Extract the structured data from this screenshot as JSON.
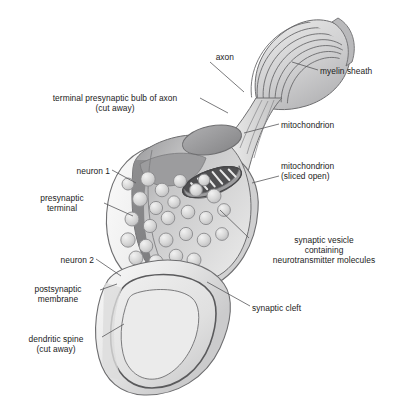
{
  "figure": {
    "background_color": "#ffffff",
    "line_color": "#58585a",
    "text_color": "#1b1b1b",
    "palette": {
      "membrane_outline": "#6e6e70",
      "cytoplasm_light": "#f1f1f1",
      "cytoplasm_mid": "#d9d9d9",
      "cut_face_dark": "#8f8f91",
      "cut_face_darker": "#7a7a7c",
      "vesicle_fill": "#d5d5d5",
      "vesicle_outline": "#8a8a8c",
      "mitochondrion_fill": "#9c9c9e",
      "mitochondrion_sliced_dark": "#4f4f51",
      "myelin_fill": "#cfcfd0",
      "spine_lumen": "#e3e3e3"
    }
  },
  "labels": [
    {
      "id": "axon",
      "name": "label-axon",
      "lines": [
        "axon"
      ],
      "align": "right",
      "x": 188,
      "y": 52,
      "width": 46
    },
    {
      "id": "myelin-sheath",
      "name": "label-myelin-sheath",
      "lines": [
        "myelin sheath"
      ],
      "align": "left",
      "x": 320,
      "y": 66,
      "width": 82
    },
    {
      "id": "terminal-presynaptic-bulb",
      "name": "label-terminal-presynaptic-bulb-of-axon",
      "lines": [
        "terminal presynaptic bulb of axon",
        "(cut away)"
      ],
      "align": "center",
      "x": 32,
      "y": 93,
      "width": 166
    },
    {
      "id": "mitochondrion",
      "name": "label-mitochondrion",
      "lines": [
        "mitochondrion"
      ],
      "align": "left",
      "x": 281,
      "y": 120,
      "width": 86
    },
    {
      "id": "mitochondrion-sliced-open",
      "name": "label-mitochondrion-sliced-open",
      "lines": [
        "mitochondrion",
        "(sliced open)"
      ],
      "align": "left",
      "x": 281,
      "y": 161,
      "width": 86
    },
    {
      "id": "neuron-1",
      "name": "label-neuron-1",
      "lines": [
        "neuron 1"
      ],
      "align": "right",
      "x": 54,
      "y": 166,
      "width": 56
    },
    {
      "id": "presynaptic-terminal",
      "name": "label-presynaptic-terminal",
      "lines": [
        "presynaptic",
        "terminal"
      ],
      "align": "center",
      "x": 22,
      "y": 193,
      "width": 80
    },
    {
      "id": "synaptic-vesicle",
      "name": "label-synaptic-vesicle",
      "lines": [
        "synaptic vesicle",
        "containing",
        "neurotransmitter molecules"
      ],
      "align": "center",
      "x": 251,
      "y": 235,
      "width": 146
    },
    {
      "id": "neuron-2",
      "name": "label-neuron-2",
      "lines": [
        "neuron 2"
      ],
      "align": "right",
      "x": 38,
      "y": 255,
      "width": 56
    },
    {
      "id": "postsynaptic-membrane",
      "name": "label-postsynaptic-membrane",
      "lines": [
        "postsynaptic",
        "membrane"
      ],
      "align": "center",
      "x": 18,
      "y": 284,
      "width": 80
    },
    {
      "id": "synaptic-cleft",
      "name": "label-synaptic-cleft",
      "lines": [
        "synaptic cleft"
      ],
      "align": "left",
      "x": 252,
      "y": 303,
      "width": 82
    },
    {
      "id": "dendritic-spine",
      "name": "label-dendritic-spine",
      "lines": [
        "dendritic spine",
        "(cut away)"
      ],
      "align": "center",
      "x": 12,
      "y": 334,
      "width": 88
    }
  ],
  "leader_lines": [
    {
      "id": "axon",
      "name": "leader-line-axon",
      "path": "M 210 62 L 244 92"
    },
    {
      "id": "myelin-sheath",
      "name": "leader-line-myelin-sheath",
      "path": "M 318 70 L 292 62"
    },
    {
      "id": "terminal-presynaptic-bulb",
      "name": "leader-line-terminal-presynaptic-bulb",
      "path": "M 200 98 L 228 113"
    },
    {
      "id": "mitochondrion",
      "name": "leader-line-mitochondrion",
      "path": "M 279 124 L 244 133"
    },
    {
      "id": "mitochondrion-sliced-open",
      "name": "leader-line-mitochondrion-sliced-open",
      "path": "M 279 176 L 252 183"
    },
    {
      "id": "neuron-1",
      "name": "leader-line-neuron-1",
      "path": "M 112 170 L 136 183"
    },
    {
      "id": "presynaptic-terminal",
      "name": "leader-line-presynaptic-terminal",
      "path": "M 104 203 L 133 216"
    },
    {
      "id": "synaptic-vesicle",
      "name": "leader-line-synaptic-vesicle",
      "path": "M 249 238 L 220 210"
    },
    {
      "id": "neuron-2",
      "name": "leader-line-neuron-2",
      "path": "M 96 259 L 121 276"
    },
    {
      "id": "postsynaptic-membrane",
      "name": "leader-line-postsynaptic-membrane",
      "path": "M 100 290 L 117 284"
    },
    {
      "id": "synaptic-cleft",
      "name": "leader-line-synaptic-cleft",
      "path": "M 250 306 L 207 282"
    },
    {
      "id": "dendritic-spine",
      "name": "leader-line-dendritic-spine",
      "path": "M 102 337 L 124 324"
    }
  ],
  "vesicles": [
    {
      "cx": 148,
      "cy": 179,
      "r": 7.2
    },
    {
      "cx": 162,
      "cy": 190,
      "r": 6.8
    },
    {
      "cx": 180,
      "cy": 181,
      "r": 6.5
    },
    {
      "cx": 140,
      "cy": 199,
      "r": 7.4
    },
    {
      "cx": 156,
      "cy": 208,
      "r": 6.6
    },
    {
      "cx": 174,
      "cy": 202,
      "r": 6.2
    },
    {
      "cx": 196,
      "cy": 190,
      "r": 6.4
    },
    {
      "cx": 214,
      "cy": 196,
      "r": 7.0
    },
    {
      "cx": 132,
      "cy": 219,
      "r": 7.0
    },
    {
      "cx": 150,
      "cy": 226,
      "r": 6.6
    },
    {
      "cx": 168,
      "cy": 218,
      "r": 6.8
    },
    {
      "cx": 188,
      "cy": 212,
      "r": 6.8
    },
    {
      "cx": 206,
      "cy": 218,
      "r": 6.6
    },
    {
      "cx": 224,
      "cy": 210,
      "r": 6.4
    },
    {
      "cx": 128,
      "cy": 240,
      "r": 7.2
    },
    {
      "cx": 146,
      "cy": 246,
      "r": 6.8
    },
    {
      "cx": 166,
      "cy": 240,
      "r": 7.0
    },
    {
      "cx": 186,
      "cy": 234,
      "r": 6.6
    },
    {
      "cx": 204,
      "cy": 240,
      "r": 6.8
    },
    {
      "cx": 222,
      "cy": 234,
      "r": 6.4
    },
    {
      "cx": 136,
      "cy": 258,
      "r": 7.0
    },
    {
      "cx": 156,
      "cy": 262,
      "r": 7.2
    },
    {
      "cx": 176,
      "cy": 256,
      "r": 6.8
    },
    {
      "cx": 194,
      "cy": 260,
      "r": 7.0
    },
    {
      "cx": 178,
      "cy": 272,
      "r": 7.0
    },
    {
      "cx": 196,
      "cy": 274,
      "r": 6.8
    },
    {
      "cx": 128,
      "cy": 184,
      "r": 6.0
    },
    {
      "cx": 204,
      "cy": 180,
      "r": 5.8
    }
  ],
  "structures": [
    {
      "id": "myelin-sheath",
      "name": "myelin-sheath-shape",
      "description": "concentric wrapped membrane layers at top right of axon"
    },
    {
      "id": "axon-stalk",
      "name": "axon-stalk-shape",
      "description": "tapering tube connecting myelinated axon to presynaptic bulb"
    },
    {
      "id": "presynaptic-bulb",
      "name": "presynaptic-bulb-shape",
      "description": "large pear-shaped terminal bulb, cut away to show interior"
    },
    {
      "id": "mitochondrion-intact",
      "name": "mitochondrion-intact-shape",
      "description": "tilted gray ellipse in upper bulb"
    },
    {
      "id": "mitochondrion-sliced",
      "name": "mitochondrion-sliced-shape",
      "description": "ellipse with dark lumen and light cristae stripes"
    },
    {
      "id": "dendritic-spine",
      "name": "dendritic-spine-shape",
      "description": "lower postsynaptic structure cut away to show lumen"
    },
    {
      "id": "synaptic-cleft",
      "name": "synaptic-cleft-gap",
      "description": "narrow gap between presynaptic bulb base and spine top"
    }
  ]
}
